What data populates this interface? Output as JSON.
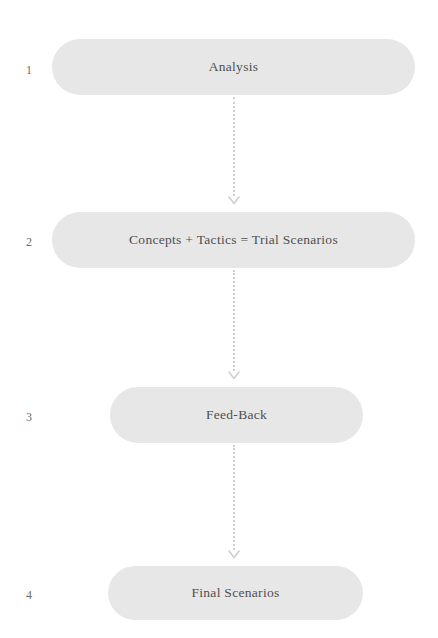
{
  "diagram": {
    "type": "vertical-flowchart",
    "canvas": {
      "width": 438,
      "height": 638
    },
    "background_color": "#ffffff",
    "box_fill_color": "#e7e7e7",
    "text_color": "#4f4f4f",
    "number_color": "#6e6e6e",
    "connector_color": "#cfcfcf",
    "steps": [
      {
        "number": "1",
        "label": "Analysis",
        "x": 52,
        "y": 39,
        "width": 363,
        "height": 56
      },
      {
        "number": "2",
        "label": "Concepts + Tactics = Trial Scenarios",
        "x": 52,
        "y": 212,
        "width": 363,
        "height": 56
      },
      {
        "number": "3",
        "label": "Feed-Back",
        "x": 110,
        "y": 387,
        "width": 253,
        "height": 56
      },
      {
        "number": "4",
        "label": "Final Scenarios",
        "x": 108,
        "y": 566,
        "width": 255,
        "height": 54
      }
    ],
    "connectors": [
      {
        "name": "connector-1-to-2",
        "x": 234,
        "y": 97,
        "length": 108
      },
      {
        "name": "connector-2-to-3",
        "x": 234,
        "y": 270,
        "length": 110
      },
      {
        "name": "connector-3-to-4",
        "x": 234,
        "y": 445,
        "length": 114
      }
    ]
  }
}
